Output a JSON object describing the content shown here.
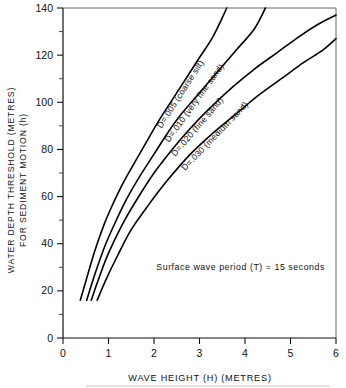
{
  "chart_data": {
    "type": "line",
    "title": "",
    "xlabel": "WAVE HEIGHT (H) (METRES)",
    "ylabel_line1": "WATER DEPTH THRESHOLD (METRES)",
    "ylabel_line2": "FOR SEDIMENT MOTION (h)",
    "xlim": [
      0,
      6
    ],
    "ylim": [
      0,
      140
    ],
    "xticks": [
      0,
      1,
      2,
      3,
      4,
      5,
      6
    ],
    "xticklabels": [
      "0",
      "1",
      "2",
      "3",
      "4",
      "5",
      "6"
    ],
    "yticks": [
      0,
      20,
      40,
      60,
      80,
      100,
      120,
      140
    ],
    "yticklabels": [
      "0",
      "20",
      "40",
      "60",
      "80",
      "100",
      "120",
      "140"
    ],
    "yminorticks": [
      10,
      30,
      50,
      70,
      90,
      110,
      130
    ],
    "grid": false,
    "legend_position": "inline-curve-labels",
    "annotations": [
      {
        "name": "wave-period-note",
        "text": "Surface  wave  period  (T) = 15 seconds",
        "x": 2.05,
        "y": 29
      }
    ],
    "series": [
      {
        "name": "D=.005 (coarse silt)",
        "label": "D=.005 (coarse silt)",
        "grain_size_mm": 0.005,
        "sediment": "coarse silt",
        "color": "#000000",
        "x": [
          0.38,
          0.5,
          0.7,
          0.9,
          1.1,
          1.3,
          1.5,
          1.8,
          2.1,
          2.4,
          2.7,
          3.0,
          3.3,
          3.6
        ],
        "y": [
          16,
          24,
          37,
          48,
          57,
          65,
          72,
          82,
          92,
          101,
          110,
          119,
          128,
          140
        ]
      },
      {
        "name": "D=.010 (very fine sand)",
        "label": "D=.010 (very fine sand)",
        "grain_size_mm": 0.01,
        "sediment": "very fine sand",
        "color": "#000000",
        "x": [
          0.52,
          0.7,
          0.9,
          1.1,
          1.4,
          1.7,
          2.0,
          2.3,
          2.6,
          3.0,
          3.4,
          3.8,
          4.2,
          4.45
        ],
        "y": [
          16,
          27,
          38,
          47,
          59,
          69,
          78,
          87,
          95,
          104,
          113,
          122,
          131,
          140
        ]
      },
      {
        "name": "D=.020 (fine sand)",
        "label": "D=.020 (fine sand)",
        "grain_size_mm": 0.02,
        "sediment": "fine sand",
        "color": "#000000",
        "x": [
          0.62,
          0.8,
          1.0,
          1.3,
          1.6,
          2.0,
          2.4,
          2.8,
          3.2,
          3.7,
          4.2,
          4.7,
          5.2,
          5.6,
          6.0
        ],
        "y": [
          16,
          26,
          36,
          48,
          58,
          70,
          80,
          89,
          97,
          106,
          114,
          121,
          128,
          133,
          137
        ]
      },
      {
        "name": "D=.030 (medium sand)",
        "label": "D=.030 (medium sand)",
        "grain_size_mm": 0.03,
        "sediment": "medium sand",
        "color": "#000000",
        "x": [
          0.75,
          0.95,
          1.2,
          1.5,
          1.9,
          2.3,
          2.8,
          3.3,
          3.8,
          4.3,
          4.8,
          5.3,
          5.7,
          6.0
        ],
        "y": [
          16,
          25,
          35,
          46,
          57,
          67,
          78,
          87,
          95,
          103,
          110,
          117,
          122,
          127
        ]
      }
    ]
  }
}
